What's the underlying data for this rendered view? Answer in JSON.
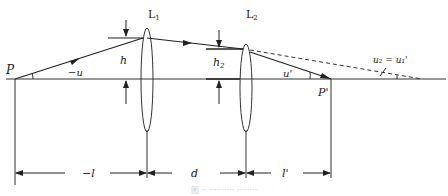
{
  "diagram": {
    "labels": {
      "object_point": "P",
      "image_point": "P'",
      "lens1": "L",
      "lens1_sub": "1",
      "lens2": "L",
      "lens2_sub": "2",
      "angle_u": "−u",
      "height_h": "h",
      "height_h2": "h",
      "height_h2_sub": "2",
      "angle_u_prime": "u'",
      "relation": "u₂ = u₁'",
      "dist_l": "−l",
      "dist_d": "d",
      "dist_l_prime": "l'"
    },
    "caption": "图 ·· ·········· ········"
  }
}
